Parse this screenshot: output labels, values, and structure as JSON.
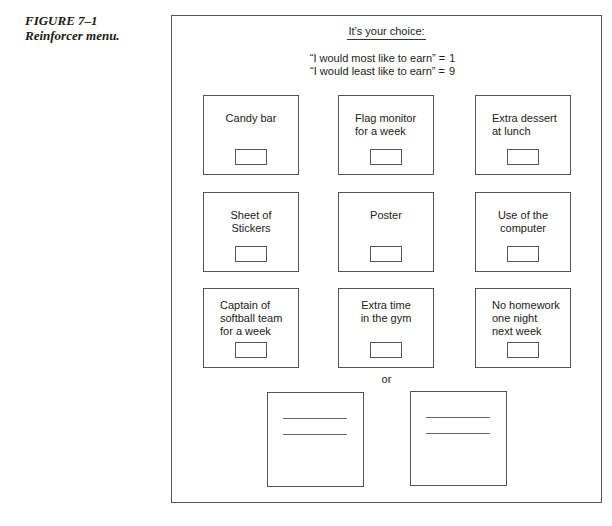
{
  "figure": {
    "number": "FIGURE 7–1",
    "caption": "Reinforcer menu."
  },
  "menu": {
    "title": "It’s your choice:",
    "scale": [
      {
        "text": "“I would most like to earn” =",
        "value": "1"
      },
      {
        "text": "“I would least like to earn” =",
        "value": "9"
      }
    ],
    "items": [
      {
        "label": "Candy bar",
        "align": "center"
      },
      {
        "label": "Flag monitor\nfor a week",
        "align": "left"
      },
      {
        "label": "Extra dessert\nat lunch",
        "align": "left"
      },
      {
        "label": "Sheet of\nStickers",
        "align": "center"
      },
      {
        "label": "Poster",
        "align": "center"
      },
      {
        "label": "Use of the\ncomputer",
        "align": "center"
      },
      {
        "label": "Captain of\nsoftball team\nfor a week",
        "align": "left"
      },
      {
        "label": "Extra time\nin the gym",
        "align": "center"
      },
      {
        "label": "No homework\none night\nnext week",
        "align": "left"
      }
    ],
    "or_label": "or",
    "write_in_boxes": 2
  }
}
